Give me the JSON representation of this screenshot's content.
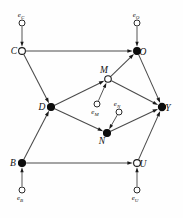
{
  "diagram": {
    "type": "directed-acyclic-graph",
    "width": 183,
    "height": 218,
    "background_color": "#fefefe",
    "edge_color": "#4a4a4a",
    "node_fill_observed": "#0d0d0d",
    "node_fill_latent": "#ffffff",
    "node_stroke": "#1a1a1a"
  },
  "nodes": [
    {
      "id": "C",
      "label": "C",
      "x": 22,
      "y": 51,
      "style": "open",
      "r": 3.4,
      "label_dx": -8,
      "label_dy": 3
    },
    {
      "id": "O",
      "label": "O",
      "x": 137,
      "y": 51,
      "style": "filled",
      "r": 3.4,
      "label_dx": 6,
      "label_dy": 3.5
    },
    {
      "id": "D",
      "label": "D",
      "x": 51,
      "y": 107,
      "style": "filled",
      "r": 3.5,
      "label_dx": -9,
      "label_dy": 3
    },
    {
      "id": "M",
      "label": "M",
      "x": 108,
      "y": 79,
      "style": "open",
      "r": 3.3,
      "label_dx": -4,
      "label_dy": -6
    },
    {
      "id": "N",
      "label": "N",
      "x": 107,
      "y": 133,
      "style": "filled",
      "r": 3.5,
      "label_dx": -5,
      "label_dy": 11
    },
    {
      "id": "Y",
      "label": "Y",
      "x": 162,
      "y": 107,
      "style": "filled",
      "r": 3.6,
      "label_dx": 6,
      "label_dy": 3.5
    },
    {
      "id": "B",
      "label": "B",
      "x": 22,
      "y": 163,
      "style": "filled",
      "r": 3.5,
      "label_dx": -9,
      "label_dy": 3
    },
    {
      "id": "U",
      "label": "U",
      "x": 137,
      "y": 163,
      "style": "open",
      "r": 3.4,
      "label_dx": 6,
      "label_dy": 3.5
    }
  ],
  "error_nodes": [
    {
      "id": "eC",
      "base": "e",
      "sub": "C",
      "x": 22,
      "y": 23,
      "r": 3.0,
      "label_dx": -1,
      "label_dy": -6,
      "target": "C"
    },
    {
      "id": "eO",
      "base": "e",
      "sub": "O",
      "x": 137,
      "y": 23,
      "r": 3.0,
      "label_dx": -1,
      "label_dy": -6,
      "target": "O"
    },
    {
      "id": "eM",
      "base": "e",
      "sub": "M",
      "x": 97,
      "y": 104,
      "r": 3.0,
      "label_dx": -2,
      "label_dy": 10,
      "target": "M"
    },
    {
      "id": "eN",
      "base": "e",
      "sub": "N",
      "x": 119,
      "y": 112,
      "r": 3.0,
      "label_dx": -2,
      "label_dy": -6,
      "target": "N"
    },
    {
      "id": "eB",
      "base": "e",
      "sub": "B",
      "x": 22,
      "y": 190,
      "r": 3.0,
      "label_dx": -2,
      "label_dy": 10,
      "target": "B"
    },
    {
      "id": "eU",
      "base": "e",
      "sub": "U",
      "x": 137,
      "y": 190,
      "r": 3.0,
      "label_dx": -2,
      "label_dy": 10,
      "target": "U"
    }
  ],
  "edges": [
    {
      "from": "C",
      "to": "O",
      "kind": "structural"
    },
    {
      "from": "C",
      "to": "D",
      "kind": "structural"
    },
    {
      "from": "D",
      "to": "M",
      "kind": "structural"
    },
    {
      "from": "D",
      "to": "N",
      "kind": "structural"
    },
    {
      "from": "M",
      "to": "O",
      "kind": "structural"
    },
    {
      "from": "M",
      "to": "Y",
      "kind": "structural"
    },
    {
      "from": "N",
      "to": "Y",
      "kind": "structural"
    },
    {
      "from": "O",
      "to": "Y",
      "kind": "structural"
    },
    {
      "from": "B",
      "to": "D",
      "kind": "structural"
    },
    {
      "from": "B",
      "to": "U",
      "kind": "structural"
    },
    {
      "from": "U",
      "to": "Y",
      "kind": "structural"
    }
  ],
  "error_edges": [
    {
      "from": "eC",
      "to": "C"
    },
    {
      "from": "eO",
      "to": "O"
    },
    {
      "from": "eM",
      "to": "M"
    },
    {
      "from": "eN",
      "to": "N"
    },
    {
      "from": "eB",
      "to": "B"
    },
    {
      "from": "eU",
      "to": "U"
    }
  ]
}
